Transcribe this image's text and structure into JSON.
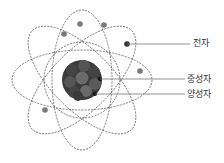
{
  "diagram": {
    "labels": {
      "electron": "전자",
      "neutron": "중성자",
      "proton": "양성자"
    },
    "colors": {
      "orbit": "#555555",
      "nucleus_dark": "#3a3a3a",
      "nucleus_light": "#6a6a6a",
      "electron": "#7a7a7a",
      "leader_line": "#777777",
      "text": "#333333"
    }
  }
}
